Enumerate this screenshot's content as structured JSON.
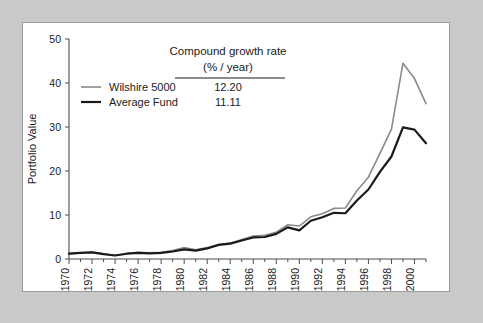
{
  "figure": {
    "background_color": "#c9c9c9",
    "panel_color": "#ffffff",
    "panel_border_color": "#9a9a9a"
  },
  "chart_data": {
    "type": "line",
    "title": "",
    "xlabel": "",
    "ylabel": "Portfolio Value",
    "xlim": [
      1970,
      2001
    ],
    "ylim": [
      0,
      50
    ],
    "yticks": [
      0,
      10,
      20,
      30,
      40,
      50
    ],
    "ytick_labels": [
      "0",
      "10",
      "20",
      "30",
      "40",
      "50"
    ],
    "xticks": [
      1970,
      1972,
      1974,
      1976,
      1978,
      1980,
      1982,
      1984,
      1986,
      1988,
      1990,
      1992,
      1994,
      1996,
      1998,
      2000
    ],
    "xtick_labels": [
      "1970",
      "1972",
      "1974",
      "1976",
      "1978",
      "1980",
      "1982",
      "1984",
      "1986",
      "1988",
      "1990",
      "1992",
      "1994",
      "1996",
      "1998",
      "2000"
    ],
    "x": [
      1970,
      1971,
      1972,
      1973,
      1974,
      1975,
      1976,
      1977,
      1978,
      1979,
      1980,
      1981,
      1982,
      1983,
      1984,
      1985,
      1986,
      1987,
      1988,
      1989,
      1990,
      1991,
      1992,
      1993,
      1994,
      1995,
      1996,
      1997,
      1998,
      1999,
      2000,
      2001
    ],
    "grid": false,
    "legend_position": "upper-left-inside",
    "series": [
      {
        "name": "Wilshire 5000",
        "color": "#8a8a8a",
        "linewidth": 1.6,
        "growth_rate": "12.20",
        "values": [
          1.2,
          1.4,
          1.6,
          1.2,
          0.8,
          1.2,
          1.5,
          1.4,
          1.5,
          1.9,
          2.6,
          2.1,
          2.6,
          3.3,
          3.6,
          4.4,
          5.2,
          5.4,
          6.1,
          7.8,
          7.5,
          9.6,
          10.3,
          11.5,
          11.6,
          15.5,
          18.6,
          24.0,
          29.5,
          44.5,
          41.0,
          35.3
        ]
      },
      {
        "name": "Average Fund",
        "color": "#1a1a1a",
        "linewidth": 2.2,
        "growth_rate": "11.11",
        "values": [
          1.2,
          1.4,
          1.5,
          1.1,
          0.8,
          1.2,
          1.4,
          1.3,
          1.4,
          1.7,
          2.2,
          1.9,
          2.4,
          3.2,
          3.5,
          4.2,
          4.9,
          5.0,
          5.7,
          7.2,
          6.5,
          8.7,
          9.5,
          10.5,
          10.4,
          13.3,
          15.8,
          19.8,
          23.3,
          29.9,
          29.4,
          26.3
        ]
      }
    ],
    "legend_table": {
      "header_line1": "Compound growth rate",
      "header_line2": "(% / year)",
      "rows": [
        {
          "label": "Wilshire 5000",
          "value": "12.20"
        },
        {
          "label": "Average Fund",
          "value": "11.11"
        }
      ]
    }
  }
}
